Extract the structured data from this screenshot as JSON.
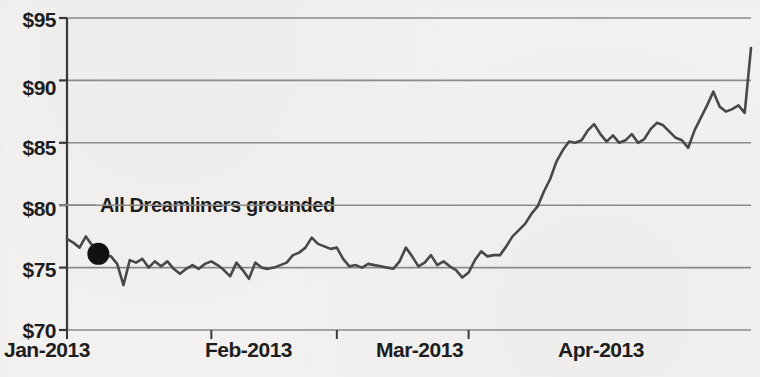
{
  "chart_data": {
    "type": "line",
    "title": "",
    "subtitle": "",
    "xlabel": "",
    "ylabel": "",
    "xlim": [
      0,
      109
    ],
    "ylim": [
      70,
      95
    ],
    "grid": true,
    "legend": false,
    "y_tick_labels": [
      "$95",
      "$90",
      "$85",
      "$80",
      "$75",
      "$70"
    ],
    "y_tick_values": [
      95,
      90,
      85,
      80,
      75,
      70
    ],
    "x_tick_labels": [
      "Jan-2013",
      "Feb-2013",
      "Mar-2013",
      "Apr-2013"
    ],
    "x_tick_values": [
      0,
      23,
      43,
      64
    ],
    "series": [
      {
        "name": "Boeing share price",
        "color": "#4a4846",
        "x": [
          0,
          1,
          2,
          3,
          4,
          5,
          6,
          7,
          8,
          9,
          10,
          11,
          12,
          13,
          14,
          15,
          16,
          17,
          18,
          19,
          20,
          21,
          22,
          23,
          24,
          25,
          26,
          27,
          28,
          29,
          30,
          31,
          32,
          33,
          34,
          35,
          36,
          37,
          38,
          39,
          40,
          41,
          42,
          43,
          44,
          45,
          46,
          47,
          48,
          49,
          50,
          51,
          52,
          53,
          54,
          55,
          56,
          57,
          58,
          59,
          60,
          61,
          62,
          63,
          64,
          65,
          66,
          67,
          68,
          69,
          70,
          71,
          72,
          73,
          74,
          75,
          76,
          77,
          78,
          79,
          80,
          81,
          82,
          83,
          84,
          85,
          86,
          87,
          88,
          89,
          90,
          91,
          92,
          93,
          94,
          95,
          96,
          97,
          98,
          99,
          100,
          101,
          102,
          103,
          104,
          105,
          106,
          107,
          108,
          109
        ],
        "values": [
          77.3,
          77.0,
          76.6,
          77.5,
          76.8,
          76.1,
          76.0,
          75.9,
          75.3,
          73.6,
          75.6,
          75.4,
          75.7,
          75.0,
          75.5,
          75.1,
          75.5,
          74.9,
          74.5,
          74.9,
          75.2,
          74.9,
          75.3,
          75.5,
          75.2,
          74.8,
          74.3,
          75.4,
          74.8,
          74.1,
          75.4,
          75.0,
          74.9,
          75.0,
          75.2,
          75.4,
          76.0,
          76.2,
          76.6,
          77.4,
          76.9,
          76.7,
          76.5,
          76.6,
          75.7,
          75.1,
          75.2,
          75.0,
          75.3,
          75.2,
          75.1,
          75.0,
          74.9,
          75.5,
          76.6,
          75.9,
          75.1,
          75.4,
          76.0,
          75.2,
          75.5,
          75.1,
          74.8,
          74.2,
          74.6,
          75.6,
          76.3,
          75.9,
          76.0,
          76.0,
          76.7,
          77.5,
          78.0,
          78.5,
          79.3,
          79.9,
          81.1,
          82.1,
          83.5,
          84.4,
          85.1,
          85.0,
          85.2,
          86.0,
          86.5,
          85.7,
          85.1,
          85.6,
          85.0,
          85.2,
          85.7,
          85.0,
          85.3,
          86.1,
          86.6,
          86.4,
          85.9,
          85.4,
          85.2,
          84.6,
          86.0,
          87.0,
          88.0,
          89.1,
          87.9,
          87.5,
          87.7,
          88.0,
          87.4,
          92.6
        ]
      }
    ],
    "annotations": [
      {
        "text": "All Dreamliners grounded",
        "marker": "filled-circle",
        "marker_x": 5,
        "marker_y": 76.1,
        "label_y_value": 80
      }
    ]
  },
  "colors": {
    "background": "#f3f1ef",
    "line": "#4a4846",
    "gridline": "#8c8a88",
    "axis": "#3a3836",
    "text": "#1d1d1d",
    "marker": "#111111"
  }
}
